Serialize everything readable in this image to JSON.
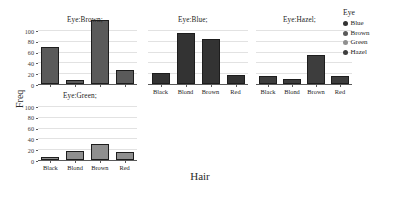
{
  "chart_data": {
    "type": "bar",
    "title": "",
    "xlabel": "Hair",
    "ylabel": "Freq",
    "categories": [
      "Black",
      "Blond",
      "Brown",
      "Red"
    ],
    "ylim": [
      0,
      120
    ],
    "yticks": [
      0,
      20,
      40,
      60,
      80,
      100
    ],
    "grid": true,
    "legend_position": "right",
    "legend_title": "Eye",
    "legend_entries": [
      {
        "label": "Blue",
        "color": "#333333"
      },
      {
        "label": "Brown",
        "color": "#5a5a5a"
      },
      {
        "label": "Green",
        "color": "#8f8f8f"
      },
      {
        "label": "Hazel",
        "color": "#3d3d3d"
      }
    ],
    "panels": [
      {
        "name": "brown",
        "title": "Eye:Brown;",
        "color": "#5a5a5a",
        "values": [
          68,
          7,
          119,
          26
        ]
      },
      {
        "name": "blue",
        "title": "Eye:Blue;",
        "color": "#333333",
        "values": [
          20,
          94,
          84,
          17
        ]
      },
      {
        "name": "hazel",
        "title": "Eye:Hazel;",
        "color": "#3d3d3d",
        "values": [
          15,
          10,
          54,
          14
        ]
      },
      {
        "name": "green",
        "title": "Eye:Green;",
        "color": "#8f8f8f",
        "values": [
          5,
          16,
          29,
          14
        ]
      }
    ]
  },
  "axes": {
    "x_title": "Hair",
    "y_title": "Freq",
    "ytick_labels": [
      "0",
      "20",
      "40",
      "60",
      "80",
      "100"
    ],
    "xtick_labels": [
      "Black",
      "Blond",
      "Brown",
      "Red"
    ]
  },
  "legend": {
    "title": "Eye",
    "items": [
      {
        "label": "Blue"
      },
      {
        "label": "Brown"
      },
      {
        "label": "Green"
      },
      {
        "label": "Hazel"
      }
    ]
  },
  "panel_titles": {
    "brown": "Eye:Brown;",
    "blue": "Eye:Blue;",
    "hazel": "Eye:Hazel;",
    "green": "Eye:Green;"
  }
}
